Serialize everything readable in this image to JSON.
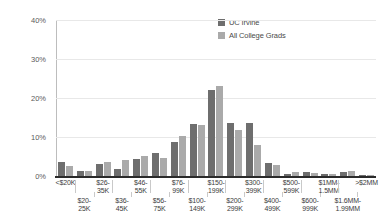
{
  "chart_data": {
    "type": "bar",
    "title": "",
    "xlabel": "",
    "ylabel": "",
    "ylim": [
      0,
      40
    ],
    "yticks": [
      "0%",
      "10%",
      "20%",
      "30%",
      "40%"
    ],
    "ytick_values": [
      0,
      10,
      20,
      30,
      40
    ],
    "grid": true,
    "legend_position": "top-right",
    "categories": [
      "<$20K",
      "$20-25K",
      "$26-35K",
      "$36-45K",
      "$46-55K",
      "$56-75K",
      "$76-99K",
      "$100-149K",
      "$150-199K",
      "$200-299K",
      "$300-399K",
      "$400-499K",
      "$500-599K",
      "$600-999K",
      "$1MM-1.5MM",
      "$1.6MM-1.99MM",
      ">$2MM"
    ],
    "categories_display": [
      "<$20K",
      "$20-\n25K",
      "$26-\n35K",
      "$36-\n45K",
      "$46-\n55K",
      "$56-\n75K",
      "$76-\n99K",
      "$100-\n149K",
      "$150-\n199K",
      "$200-\n299K",
      "$300-\n399K",
      "$400-\n499K",
      "$500-\n599K",
      "$600-\n999K",
      "$1MM-\n1.5MM",
      "$1.6MM-\n1.99MM",
      ">$2MM"
    ],
    "series": [
      {
        "name": "UC Irvine",
        "color": "#6e6e6e",
        "values": [
          3.6,
          1.2,
          3.0,
          1.9,
          4.3,
          6.0,
          8.7,
          13.4,
          22.0,
          13.6,
          13.5,
          3.3,
          0.6,
          1.0,
          0.5,
          1.0,
          0.2
        ]
      },
      {
        "name": "All College Grads",
        "color": "#aaaaaa",
        "values": [
          2.5,
          1.2,
          3.6,
          4.0,
          5.1,
          4.7,
          10.2,
          13.0,
          23.2,
          11.8,
          8.0,
          2.8,
          1.1,
          0.9,
          0.4,
          1.2,
          0.2
        ]
      }
    ]
  },
  "legend": {
    "items": [
      {
        "label": "UC Irvine",
        "color": "#6e6e6e"
      },
      {
        "label": "All College Grads",
        "color": "#aaaaaa"
      }
    ]
  }
}
